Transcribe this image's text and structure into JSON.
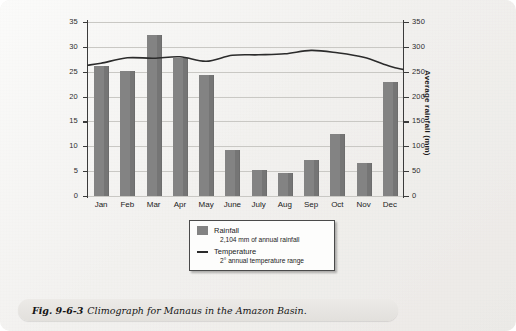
{
  "figure": {
    "caption_number": "Fig. 9-6-3",
    "caption_text": "Climograph for Manaus in the Amazon Basin."
  },
  "chart_data": {
    "type": "bar",
    "title": "Climograph for Manaus in the Amazon Basin",
    "categories": [
      "Jan",
      "Feb",
      "Mar",
      "Apr",
      "May",
      "June",
      "July",
      "Aug",
      "Sep",
      "Oct",
      "Nov",
      "Dec"
    ],
    "xlabel": "",
    "ylabel": "Average temperature (°C)",
    "ylabel_right": "Average rainfall (mm)",
    "ylim": [
      0,
      35
    ],
    "ylim_right": [
      0,
      350
    ],
    "yticks": [
      0,
      5,
      10,
      15,
      20,
      25,
      30,
      35
    ],
    "yticks_right": [
      0,
      50,
      100,
      150,
      200,
      250,
      300,
      350
    ],
    "grid": true,
    "legend_position": "below-center",
    "series": [
      {
        "name": "Rainfall",
        "type": "bar",
        "axis": "right",
        "unit": "mm",
        "color": "#838383",
        "values": [
          261,
          252,
          323,
          278,
          244,
          93,
          52,
          46,
          73,
          124,
          67,
          230
        ]
      },
      {
        "name": "Temperature",
        "type": "line",
        "axis": "left",
        "unit": "°C",
        "color": "#2b2b2b",
        "values": [
          26.7,
          27.8,
          27.7,
          28.0,
          27.1,
          28.3,
          28.4,
          28.6,
          29.3,
          28.8,
          27.9,
          26.1
        ]
      }
    ]
  },
  "legend": {
    "rainfall_label": "Rainfall",
    "rainfall_note": "2,104 mm of annual rainfall",
    "temperature_label": "Temperature",
    "temperature_note": "2° annual temperature range"
  },
  "axes": {
    "left_title": "Average temperature (°C)",
    "right_title": "Average rainfall (mm)"
  }
}
